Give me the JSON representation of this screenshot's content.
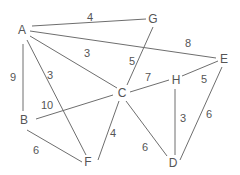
{
  "graph": {
    "nodes": [
      {
        "id": "A",
        "label": "A",
        "x": 22,
        "y": 30
      },
      {
        "id": "G",
        "label": "G",
        "x": 153,
        "y": 19
      },
      {
        "id": "E",
        "label": "E",
        "x": 224,
        "y": 59
      },
      {
        "id": "H",
        "label": "H",
        "x": 176,
        "y": 80
      },
      {
        "id": "C",
        "label": "C",
        "x": 122,
        "y": 93
      },
      {
        "id": "B",
        "label": "B",
        "x": 24,
        "y": 120
      },
      {
        "id": "F",
        "label": "F",
        "x": 88,
        "y": 162
      },
      {
        "id": "D",
        "label": "D",
        "x": 173,
        "y": 163
      }
    ],
    "edges": [
      {
        "from": "A",
        "to": "G",
        "weight": "4",
        "x1": 32,
        "y1": 26,
        "x2": 146,
        "y2": 19,
        "lx": 90,
        "ly": 17
      },
      {
        "from": "A",
        "to": "E",
        "weight": "8",
        "x1": 30,
        "y1": 31,
        "x2": 216,
        "y2": 58,
        "lx": 188,
        "ly": 43
      },
      {
        "from": "A",
        "to": "C",
        "weight": "3",
        "x1": 30,
        "y1": 36,
        "x2": 117,
        "y2": 88,
        "lx": 87,
        "ly": 53
      },
      {
        "from": "A",
        "to": "F",
        "weight": "3",
        "x1": 27,
        "y1": 40,
        "x2": 86,
        "y2": 155,
        "lx": 50,
        "ly": 75
      },
      {
        "from": "A",
        "to": "B",
        "weight": "9",
        "x1": 23,
        "y1": 44,
        "x2": 23,
        "y2": 111,
        "lx": 13,
        "ly": 77
      },
      {
        "from": "G",
        "to": "C",
        "weight": "5",
        "x1": 153,
        "y1": 27,
        "x2": 127,
        "y2": 85,
        "lx": 132,
        "ly": 61
      },
      {
        "from": "C",
        "to": "H",
        "weight": "7",
        "x1": 130,
        "y1": 92,
        "x2": 169,
        "y2": 80,
        "lx": 148,
        "ly": 77
      },
      {
        "from": "H",
        "to": "E",
        "weight": "5",
        "x1": 182,
        "y1": 76,
        "x2": 218,
        "y2": 61,
        "lx": 204,
        "ly": 79
      },
      {
        "from": "H",
        "to": "D",
        "weight": "3",
        "x1": 175,
        "y1": 89,
        "x2": 175,
        "y2": 155,
        "lx": 183,
        "ly": 118
      },
      {
        "from": "E",
        "to": "D",
        "weight": "6",
        "x1": 222,
        "y1": 67,
        "x2": 180,
        "y2": 160,
        "lx": 209,
        "ly": 114
      },
      {
        "from": "B",
        "to": "C",
        "weight": "10",
        "x1": 36,
        "y1": 119,
        "x2": 113,
        "y2": 95,
        "lx": 47,
        "ly": 105
      },
      {
        "from": "B",
        "to": "F",
        "weight": "6",
        "x1": 27,
        "y1": 130,
        "x2": 82,
        "y2": 162,
        "lx": 36,
        "ly": 150
      },
      {
        "from": "C",
        "to": "F",
        "weight": "4",
        "x1": 119,
        "y1": 101,
        "x2": 98,
        "y2": 160,
        "lx": 113,
        "ly": 133
      },
      {
        "from": "C",
        "to": "D",
        "weight": "6",
        "x1": 126,
        "y1": 101,
        "x2": 167,
        "y2": 156,
        "lx": 145,
        "ly": 147
      }
    ]
  }
}
